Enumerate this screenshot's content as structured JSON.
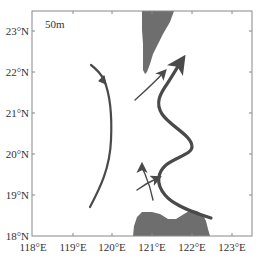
{
  "map": {
    "depth_label": "50m",
    "frame": {
      "left": 32,
      "top": 11,
      "right": 252,
      "bottom": 236
    },
    "colors": {
      "land": "#6e6e6e",
      "current": "#4a4a4a",
      "frame": "#888888",
      "text": "#333333"
    },
    "y_axis": {
      "ticks": [
        {
          "label": "23°N",
          "y": 31
        },
        {
          "label": "22°N",
          "y": 72
        },
        {
          "label": "21°N",
          "y": 113
        },
        {
          "label": "20°N",
          "y": 154
        },
        {
          "label": "19°N",
          "y": 195
        },
        {
          "label": "18°N",
          "y": 236
        }
      ]
    },
    "x_axis": {
      "ticks": [
        {
          "label": "118°E",
          "x": 33
        },
        {
          "label": "119°E",
          "x": 73
        },
        {
          "label": "120°E",
          "x": 112
        },
        {
          "label": "121°E",
          "x": 152
        },
        {
          "label": "122°E",
          "x": 192
        },
        {
          "label": "123°E",
          "x": 232
        }
      ]
    },
    "landmasses": [
      {
        "name": "Taiwan (southern tip)"
      },
      {
        "name": "Luzon (northern coast)"
      }
    ],
    "currents": [
      {
        "name": "western-arc-current",
        "direction": "northward, curving northwest"
      },
      {
        "name": "kuroshio-main-path",
        "direction": "northward, meandering S-shape"
      },
      {
        "name": "upper-branch-current",
        "direction": "northeastward"
      },
      {
        "name": "lower-crossing-current-east",
        "direction": "northeastward"
      },
      {
        "name": "lower-crossing-current-north",
        "direction": "northward"
      }
    ]
  }
}
